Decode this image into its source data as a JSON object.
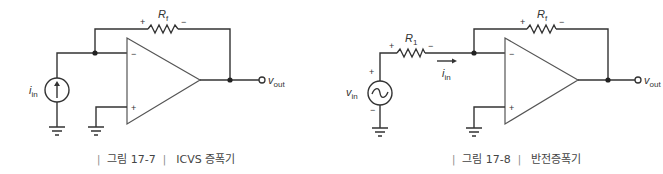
{
  "figures": [
    {
      "id": "fig-17-7",
      "caption": {
        "prefix_bar": "|",
        "number": "그림 17-7",
        "suffix_bar": "|",
        "title": "ICVS 증폭기"
      },
      "components": {
        "feedback_resistor": {
          "name": "R",
          "sub": "f",
          "plus": "+",
          "minus": "−"
        },
        "current_source": {
          "name": "i",
          "sub": "in"
        },
        "opamp": {
          "inverting": "−",
          "noninverting": "+"
        },
        "output": {
          "name": "v",
          "sub": "out"
        }
      }
    },
    {
      "id": "fig-17-8",
      "caption": {
        "prefix_bar": "|",
        "number": "그림 17-8",
        "suffix_bar": "|",
        "title": "반전증폭기"
      },
      "components": {
        "input_resistor": {
          "name": "R",
          "sub": "1",
          "plus": "+",
          "minus": "−"
        },
        "feedback_resistor": {
          "name": "R",
          "sub": "f",
          "plus": "+",
          "minus": "−"
        },
        "voltage_source": {
          "name": "v",
          "sub": "in",
          "plus": "+",
          "minus": "−"
        },
        "input_current": {
          "name": "i",
          "sub": "in"
        },
        "opamp": {
          "inverting": "−",
          "noninverting": "+"
        },
        "output": {
          "name": "v",
          "sub": "out"
        }
      }
    }
  ],
  "colors": {
    "wire": "#333333",
    "opamp_outline": "#555555",
    "caption_text": "#444444"
  }
}
